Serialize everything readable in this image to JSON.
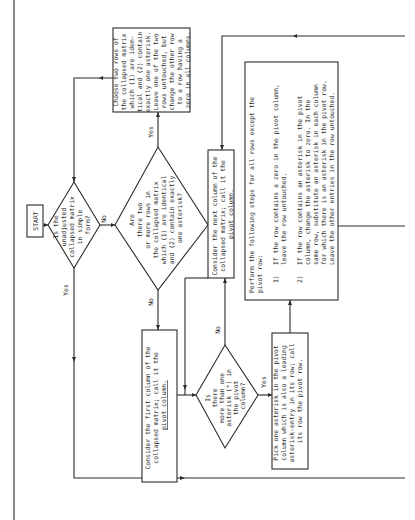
{
  "document": {
    "type": "flowchart (rotated page)",
    "orientation": "rotated 90 degrees counter-clockwise"
  },
  "flowchart": {
    "start": {
      "label": "START"
    },
    "decision_simple_form": {
      "lines": [
        "Is the",
        "unadjusted",
        "collapsed matrix",
        "in simple",
        "form?"
      ],
      "yes_label": "Yes",
      "no_label": "No"
    },
    "decision_identical_rows": {
      "lines": [
        "Are",
        "there two",
        "or more rows in",
        "the collapsed matrix",
        "which (1) are identical",
        "and (2) contain exactly",
        "one asterisk?"
      ],
      "yes_label": "Yes",
      "no_label": "No"
    },
    "box_choose_two_rows": {
      "lines": [
        "Choose two rows of",
        "the collapsed matrix",
        "which (1) are iden-",
        "tical and (2) contain",
        "exactly one asterisk.",
        "Leave one of the two",
        "rows untouched, but",
        "change the other row",
        "to a row having a",
        "zero in all columns."
      ]
    },
    "box_first_column": {
      "lines": [
        "Consider the first column of the",
        "collapsed matrix; call it the",
        "pivot column."
      ],
      "underlined": "pivot column"
    },
    "box_next_column": {
      "lines": [
        "Consider the next column of the",
        "collapsed matrix; call it the",
        "pivot column."
      ]
    },
    "decision_more_than_one_asterisk": {
      "lines": [
        "Is",
        "there",
        "more than one",
        "asterisk (*) in",
        "the pivot",
        "column?"
      ],
      "yes_label": "Yes",
      "no_label": "No"
    },
    "box_pick_asterisk": {
      "lines": [
        "Pick one asterisk in the pivot",
        "column which is also a leading",
        "asterisk-entry in its row; call",
        "its row the pivot row."
      ],
      "underlined": "pivot row"
    },
    "box_perform_steps": {
      "intro": [
        "Perform the following steps for all rows except the",
        "pivot row:"
      ],
      "underlined": "except",
      "steps": [
        {
          "num": "1)",
          "lines": [
            "If the row contains a zero in the pivot column,",
            "leave the row untouched."
          ]
        },
        {
          "num": "2)",
          "lines": [
            "If the row contains an asterisk in the pivot",
            "column, change the asterisk to zero.  In the",
            "same row, substitute an asterisk in each column",
            "for which there is an asterisk in the pivot row.",
            "Leave the other entries in the row untouched."
          ]
        }
      ]
    }
  }
}
